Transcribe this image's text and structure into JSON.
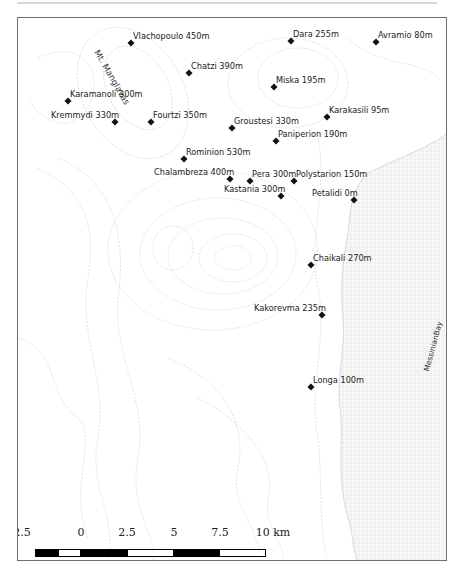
{
  "map": {
    "region_labels": {
      "mountain": "Mt. Manglavas",
      "bay": "MessinianBay"
    },
    "places": [
      {
        "name": "Vlachopoulo 450m",
        "x": 130,
        "y": 42
      },
      {
        "name": "Dara 255m",
        "x": 290,
        "y": 40
      },
      {
        "name": "Avramio 80m",
        "x": 375,
        "y": 41
      },
      {
        "name": "Chatzi 390m",
        "x": 188,
        "y": 72
      },
      {
        "name": "Miska 195m",
        "x": 273,
        "y": 86
      },
      {
        "name": "Karamanoli 300m",
        "x": 67,
        "y": 100
      },
      {
        "name": "Kremmydi 330m",
        "x": 114,
        "y": 121
      },
      {
        "name": "Fourtzi 350m",
        "x": 150,
        "y": 121
      },
      {
        "name": "Karakasili 95m",
        "x": 326,
        "y": 116
      },
      {
        "name": "Groustesi 330m",
        "x": 231,
        "y": 127
      },
      {
        "name": "Paniperion 190m",
        "x": 275,
        "y": 140
      },
      {
        "name": "Rominion 530m",
        "x": 183,
        "y": 158
      },
      {
        "name": "Chalambreza 400m",
        "x": 229,
        "y": 178
      },
      {
        "name": "Pera 300m",
        "x": 249,
        "y": 180
      },
      {
        "name": "Polystarion 150m",
        "x": 293,
        "y": 180
      },
      {
        "name": "Kastania 300m",
        "x": 280,
        "y": 195
      },
      {
        "name": "Petalidi 0m",
        "x": 353,
        "y": 199
      },
      {
        "name": "Chaikali 270m",
        "x": 310,
        "y": 264
      },
      {
        "name": "Kakorevma 235m",
        "x": 321,
        "y": 314
      },
      {
        "name": "Longa 100m",
        "x": 310,
        "y": 386
      }
    ]
  },
  "scale_bar": {
    "ticks": [
      "2.5",
      "0",
      "2.5",
      "5",
      "7.5",
      "10 km"
    ],
    "unit": "km"
  },
  "colors": {
    "sea": "#f1f1f1",
    "contour": "#d6d6d6",
    "frame": "#6e6e6e"
  }
}
